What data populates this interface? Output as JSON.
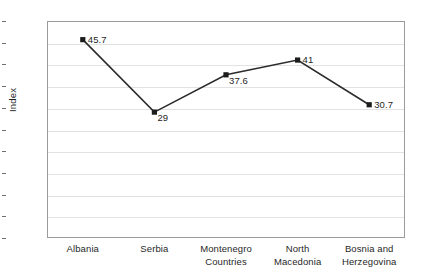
{
  "chart_data": {
    "type": "line",
    "title": "",
    "subtitle": "",
    "xlabel": "Countries",
    "ylabel": "Index",
    "categories": [
      "Albania",
      "Serbia",
      "Montenegro",
      "North Macedonia",
      "Bosnia and Herzegovina"
    ],
    "values": [
      45.7,
      29,
      37.6,
      41,
      30.7
    ],
    "point_labels": [
      "45.7",
      "29",
      "37.6",
      "41",
      "30.7"
    ],
    "series": [
      {
        "name": "Index",
        "values": [
          45.7,
          29,
          37.6,
          41,
          30.7
        ],
        "marker": "square",
        "color": "#1c1c1c"
      }
    ],
    "ylim": [
      0,
      50
    ],
    "ytick_step": 5,
    "ytick_labels": [
      "50",
      "45",
      "40",
      "35",
      "30",
      "25",
      "20",
      "15",
      "10",
      "5",
      "0"
    ],
    "ytick_values": [
      50,
      45,
      40,
      35,
      30,
      25,
      20,
      15,
      10,
      5,
      0
    ],
    "grid": "horizontal",
    "grid_color": "#e2e2e2",
    "legend": "none",
    "plot_border_color": "#9a9a9a",
    "background": "#ffffff",
    "x_category_lines": [
      [
        "Albania"
      ],
      [
        "Serbia"
      ],
      [
        "Montenegro"
      ],
      [
        "North",
        "Macedonia"
      ],
      [
        "Bosnia and",
        "Herzegovina"
      ]
    ]
  }
}
